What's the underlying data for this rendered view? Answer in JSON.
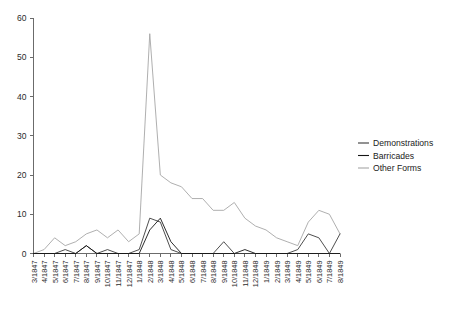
{
  "chart_data": {
    "type": "line",
    "title": "",
    "subtitle": "",
    "xlabel": "",
    "ylabel": "",
    "ylim": [
      0,
      60
    ],
    "yticks": [
      0,
      10,
      20,
      30,
      40,
      50,
      60
    ],
    "grid": false,
    "legend_position": "right",
    "categories": [
      "3/1847",
      "4/1847",
      "5/1847",
      "6/1847",
      "7/1847",
      "8/1847",
      "9/1847",
      "10/1847",
      "11/1847",
      "12/1847",
      "1/1848",
      "2/1848",
      "3/1848",
      "4/1848",
      "5/1848",
      "6/1848",
      "7/1848",
      "8/1848",
      "9/1848",
      "10/1848",
      "11/1848",
      "12/1848",
      "1/1849",
      "2/1849",
      "3/1849",
      "4/1849",
      "5/1849",
      "6/1849",
      "7/1849",
      "8/1849"
    ],
    "series": [
      {
        "name": "Demonstrations",
        "color": "#3a3a3a",
        "values": [
          0,
          0,
          0,
          1,
          0,
          2,
          0,
          1,
          0,
          0,
          1,
          9,
          8,
          1,
          0,
          0,
          0,
          0,
          3,
          0,
          0,
          0,
          0,
          0,
          0,
          1,
          5,
          4,
          0,
          5
        ]
      },
      {
        "name": "Barricades",
        "color": "#151515",
        "values": [
          0,
          0,
          0,
          0,
          0,
          2,
          0,
          0,
          0,
          0,
          0,
          6,
          9,
          3,
          0,
          0,
          0,
          0,
          0,
          0,
          1,
          0,
          0,
          0,
          0,
          0,
          0,
          0,
          0,
          0
        ]
      },
      {
        "name": "Other Forms",
        "color": "#a6a6a6",
        "values": [
          0,
          1,
          4,
          2,
          3,
          5,
          6,
          4,
          6,
          3,
          5,
          56,
          20,
          18,
          17,
          14,
          14,
          11,
          11,
          13,
          9,
          7,
          6,
          4,
          3,
          2,
          8,
          11,
          10,
          5
        ]
      }
    ]
  },
  "legend": {
    "items": [
      {
        "label": "Demonstrations",
        "swatch": "#3a3a3a"
      },
      {
        "label": "Barricades",
        "swatch": "#151515"
      },
      {
        "label": "Other Forms",
        "swatch": "#a6a6a6"
      }
    ]
  },
  "axes": {
    "y_tick_labels": [
      "60",
      "50",
      "40",
      "30",
      "20",
      "10",
      "0"
    ]
  }
}
